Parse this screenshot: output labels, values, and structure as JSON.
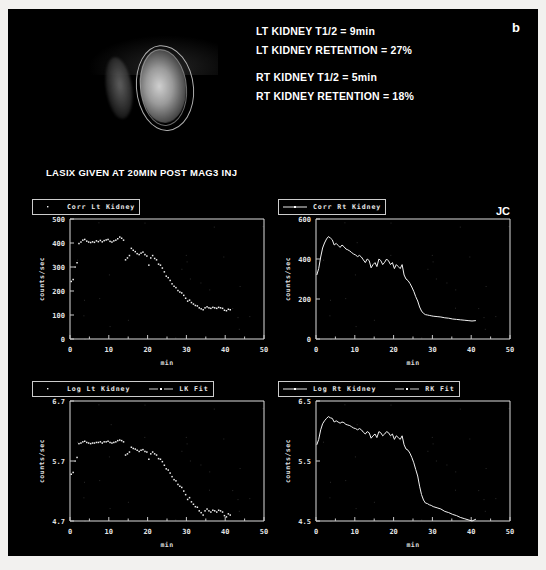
{
  "study": {
    "panel_letter": "b",
    "initials": "JC",
    "lasix_note": "LASIX GIVEN AT 20MIN POST MAG3 INJ",
    "report_lines": [
      "LT KIDNEY T1/2 = 9min",
      "LT KIDNEY RETENTION = 27%",
      "",
      "RT KIDNEY T1/2 = 5min",
      "RT KIDNEY RETENTION = 18%"
    ],
    "scan_label": "renal-scintigraphy-image",
    "colors": {
      "background": "#000000",
      "foreground": "#ffffff",
      "frame": "#f2f1ef",
      "trace": "#f0f0f0"
    }
  },
  "chart_data": [
    {
      "id": "corr-lt-kidney",
      "type": "scatter",
      "title": "Corr Lt Kidney",
      "legend": [
        {
          "label": "Corr Lt Kidney",
          "marker": "dots"
        }
      ],
      "xlabel": "min",
      "ylabel": "counts/sec",
      "xlim": [
        0,
        50
      ],
      "ylim": [
        0,
        500
      ],
      "xticks": [
        0,
        10,
        20,
        30,
        40,
        50
      ],
      "yticks": [
        0,
        100,
        200,
        300,
        400,
        500
      ],
      "grid": false,
      "legend_position": "above-left",
      "x": [
        0.3,
        0.8,
        1.3,
        1.8,
        2.3,
        2.8,
        3.3,
        3.8,
        4.3,
        4.8,
        5.3,
        5.8,
        6.3,
        6.8,
        7.3,
        7.8,
        8.3,
        8.8,
        9.3,
        9.8,
        10.3,
        10.8,
        11.3,
        11.8,
        12.3,
        12.8,
        13.3,
        13.8,
        14.3,
        14.8,
        15.3,
        15.8,
        16.3,
        16.8,
        17.3,
        17.8,
        18.3,
        18.8,
        19.3,
        19.8,
        20.3,
        20.8,
        21.3,
        21.8,
        22.3,
        22.8,
        23.3,
        23.8,
        24.3,
        24.8,
        25.3,
        25.8,
        26.3,
        26.8,
        27.3,
        27.8,
        28.3,
        28.8,
        29.3,
        29.8,
        30.3,
        30.8,
        31.3,
        31.8,
        32.3,
        32.8,
        33.3,
        33.8,
        34.3,
        34.8,
        35.3,
        35.8,
        36.3,
        36.8,
        37.3,
        37.8,
        38.3,
        38.8,
        39.3,
        39.8,
        40.3,
        40.8,
        41.3
      ],
      "y": [
        240,
        248,
        300,
        318,
        398,
        404,
        412,
        415,
        408,
        404,
        402,
        405,
        403,
        409,
        406,
        411,
        405,
        410,
        413,
        415,
        407,
        404,
        409,
        412,
        418,
        425,
        420,
        412,
        330,
        338,
        348,
        378,
        370,
        364,
        356,
        352,
        358,
        362,
        352,
        346,
        308,
        338,
        348,
        336,
        330,
        312,
        308,
        296,
        280,
        262,
        256,
        244,
        230,
        220,
        214,
        202,
        196,
        192,
        182,
        170,
        158,
        162,
        152,
        146,
        140,
        138,
        130,
        126,
        122,
        130,
        134,
        130,
        128,
        132,
        130,
        128,
        132,
        130,
        128,
        120,
        118,
        124,
        122
      ]
    },
    {
      "id": "corr-rt-kidney",
      "type": "line",
      "title": "Corr Rt Kidney",
      "legend": [
        {
          "label": "Corr Rt Kidney",
          "marker": "line"
        }
      ],
      "xlabel": "min",
      "ylabel": "counts/sec",
      "xlim": [
        0,
        50
      ],
      "ylim": [
        0,
        600
      ],
      "xticks": [
        0,
        10,
        20,
        30,
        40,
        50
      ],
      "yticks": [
        0,
        200,
        400,
        600
      ],
      "grid": false,
      "legend_position": "above-left",
      "x": [
        0.2,
        0.7,
        1.2,
        1.7,
        2.2,
        2.7,
        3.2,
        3.7,
        4.2,
        4.7,
        5.2,
        5.7,
        6.2,
        6.7,
        7.2,
        7.7,
        8.2,
        8.7,
        9.2,
        9.7,
        10.2,
        10.7,
        11.2,
        11.7,
        12.2,
        12.7,
        13.2,
        13.7,
        14.2,
        14.7,
        15.2,
        15.7,
        16.2,
        16.7,
        17.2,
        17.7,
        18.2,
        18.7,
        19.2,
        19.7,
        20.2,
        20.7,
        21.2,
        21.7,
        22.2,
        22.7,
        23.2,
        23.7,
        24.2,
        24.7,
        25.2,
        25.7,
        26.2,
        26.7,
        27.2,
        27.7,
        28.2,
        28.7,
        29.2,
        29.7,
        30.2,
        31.2,
        32.2,
        33.2,
        34.2,
        35.2,
        36.2,
        37.2,
        38.2,
        39.2,
        40.2,
        41.2
      ],
      "y": [
        320,
        352,
        410,
        455,
        480,
        500,
        512,
        505,
        496,
        470,
        478,
        468,
        458,
        470,
        462,
        450,
        446,
        440,
        432,
        425,
        420,
        412,
        418,
        410,
        396,
        382,
        400,
        392,
        356,
        372,
        382,
        362,
        400,
        392,
        372,
        384,
        400,
        390,
        372,
        382,
        352,
        372,
        362,
        352,
        372,
        320,
        300,
        292,
        278,
        260,
        238,
        212,
        190,
        160,
        140,
        128,
        122,
        120,
        118,
        116,
        114,
        112,
        110,
        106,
        104,
        100,
        98,
        96,
        94,
        92,
        90,
        92
      ]
    },
    {
      "id": "log-lt-kidney",
      "type": "scatter",
      "title": "Log Lt Kidney",
      "legend": [
        {
          "label": "Log Lt Kidney",
          "marker": "dots"
        },
        {
          "label": "LK Fit",
          "marker": "line-dot"
        }
      ],
      "xlabel": "min",
      "ylabel": "counts/sec",
      "xlim": [
        0,
        50
      ],
      "ylim": [
        4.7,
        6.7
      ],
      "xticks": [
        0,
        10,
        20,
        30,
        40,
        50
      ],
      "yticks": [
        4.7,
        5.7,
        6.7
      ],
      "grid": false,
      "legend_position": "above-left",
      "x": [
        0.3,
        0.8,
        1.3,
        1.8,
        2.3,
        2.8,
        3.3,
        3.8,
        4.3,
        4.8,
        5.3,
        5.8,
        6.3,
        6.8,
        7.3,
        7.8,
        8.3,
        8.8,
        9.3,
        9.8,
        10.3,
        10.8,
        11.3,
        11.8,
        12.3,
        12.8,
        13.3,
        13.8,
        14.3,
        14.8,
        15.3,
        15.8,
        16.3,
        16.8,
        17.3,
        17.8,
        18.3,
        18.8,
        19.3,
        19.8,
        20.3,
        20.8,
        21.3,
        21.8,
        22.3,
        22.8,
        23.3,
        23.8,
        24.3,
        24.8,
        25.3,
        25.8,
        26.3,
        26.8,
        27.3,
        27.8,
        28.3,
        28.8,
        29.3,
        29.8,
        30.3,
        30.8,
        31.3,
        31.8,
        32.3,
        32.8,
        33.3,
        33.8,
        34.3,
        34.8,
        35.3,
        35.8,
        36.3,
        36.8,
        37.3,
        37.8,
        38.3,
        38.8,
        39.3,
        39.8,
        40.3,
        40.8,
        41.3
      ],
      "y": [
        5.48,
        5.51,
        5.7,
        5.76,
        5.99,
        6.0,
        6.02,
        6.03,
        6.01,
        6.0,
        5.99,
        6.0,
        6.0,
        6.01,
        6.01,
        6.02,
        6.0,
        6.02,
        6.02,
        6.03,
        6.01,
        6.0,
        6.01,
        6.02,
        6.04,
        6.05,
        6.04,
        6.02,
        5.8,
        5.82,
        5.85,
        5.93,
        5.91,
        5.9,
        5.88,
        5.86,
        5.88,
        5.89,
        5.86,
        5.85,
        5.73,
        5.82,
        5.85,
        5.82,
        5.8,
        5.74,
        5.73,
        5.69,
        5.63,
        5.57,
        5.55,
        5.5,
        5.44,
        5.39,
        5.37,
        5.31,
        5.28,
        5.26,
        5.2,
        5.14,
        5.06,
        5.09,
        5.02,
        4.98,
        4.94,
        4.93,
        4.87,
        4.84,
        4.8,
        4.87,
        4.9,
        4.87,
        4.85,
        4.88,
        4.87,
        4.85,
        4.88,
        4.87,
        4.85,
        4.79,
        4.77,
        4.82,
        4.8
      ]
    },
    {
      "id": "log-rt-kidney",
      "type": "line",
      "title": "Log Rt Kidney",
      "legend": [
        {
          "label": "Log Rt Kidney",
          "marker": "line"
        },
        {
          "label": "RK Fit",
          "marker": "line-dot"
        }
      ],
      "xlabel": "min",
      "ylabel": "counts/sec",
      "xlim": [
        0,
        50
      ],
      "ylim": [
        4.5,
        6.5
      ],
      "xticks": [
        0,
        10,
        20,
        30,
        40,
        50
      ],
      "yticks": [
        4.5,
        5.5,
        6.5
      ],
      "grid": false,
      "legend_position": "above-left",
      "x": [
        0.2,
        0.7,
        1.2,
        1.7,
        2.2,
        2.7,
        3.2,
        3.7,
        4.2,
        4.7,
        5.2,
        5.7,
        6.2,
        6.7,
        7.2,
        7.7,
        8.2,
        8.7,
        9.2,
        9.7,
        10.2,
        10.7,
        11.2,
        11.7,
        12.2,
        12.7,
        13.2,
        13.7,
        14.2,
        14.7,
        15.2,
        15.7,
        16.2,
        16.7,
        17.2,
        17.7,
        18.2,
        18.7,
        19.2,
        19.7,
        20.2,
        20.7,
        21.2,
        21.7,
        22.2,
        22.7,
        23.2,
        23.7,
        24.2,
        24.7,
        25.2,
        25.7,
        26.2,
        26.7,
        27.2,
        27.7,
        28.2,
        28.7,
        29.2,
        29.7,
        30.2,
        31.2,
        32.2,
        33.2,
        34.2,
        35.2,
        36.2,
        37.2,
        38.2,
        39.2,
        40.2,
        41.2
      ],
      "y": [
        5.77,
        5.86,
        6.02,
        6.12,
        6.17,
        6.21,
        6.24,
        6.22,
        6.21,
        6.15,
        6.17,
        6.15,
        6.13,
        6.15,
        6.14,
        6.11,
        6.1,
        6.09,
        6.07,
        6.05,
        6.04,
        6.02,
        6.04,
        6.02,
        5.98,
        5.95,
        5.99,
        5.97,
        5.88,
        5.92,
        5.95,
        5.89,
        5.99,
        5.97,
        5.92,
        5.95,
        5.99,
        5.97,
        5.92,
        5.95,
        5.86,
        5.92,
        5.89,
        5.86,
        5.92,
        5.77,
        5.7,
        5.68,
        5.63,
        5.56,
        5.47,
        5.36,
        5.25,
        5.08,
        4.94,
        4.85,
        4.8,
        4.79,
        4.77,
        4.76,
        4.74,
        4.72,
        4.7,
        4.66,
        4.64,
        4.61,
        4.59,
        4.56,
        4.54,
        4.52,
        4.5,
        4.53
      ]
    }
  ]
}
